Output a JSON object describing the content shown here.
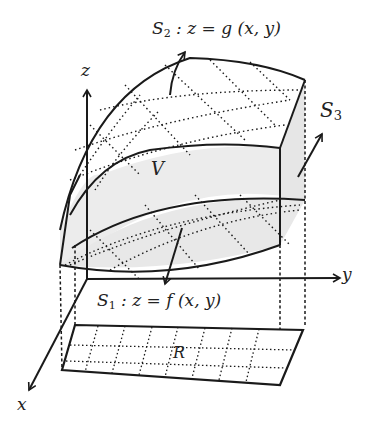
{
  "labels": {
    "s2": {
      "name": "S",
      "sub": "2",
      "eq": ": z = g (x, y)"
    },
    "s1": {
      "name": "S",
      "sub": "1",
      "eq": ": z = f (x, y)"
    },
    "s3": {
      "name": "S",
      "sub": "3"
    },
    "volume": "V",
    "region": "R",
    "axis_x": "x",
    "axis_y": "y",
    "axis_z": "z"
  },
  "colors": {
    "ink": "#1a1a1a",
    "shade": "#ececec",
    "background": "#ffffff"
  }
}
